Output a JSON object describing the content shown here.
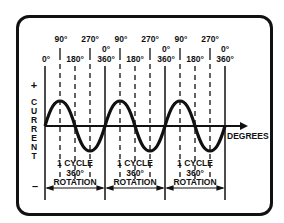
{
  "axis": {
    "y_label_letters": [
      "C",
      "U",
      "R",
      "R",
      "E",
      "N",
      "T"
    ],
    "y_plus": "+",
    "y_minus": "–",
    "x_label": "DEGREES"
  },
  "degree_labels": [
    {
      "text": "0°",
      "row": "low"
    },
    {
      "text": "90°",
      "row": "high"
    },
    {
      "text": "180°",
      "row": "low"
    },
    {
      "text": "270°",
      "row": "high"
    },
    {
      "text": "0°",
      "text2": "360°",
      "row": "mid"
    },
    {
      "text": "90°",
      "row": "high"
    },
    {
      "text": "180°",
      "row": "low"
    },
    {
      "text": "270°",
      "row": "high"
    },
    {
      "text": "0°",
      "text2": "360°",
      "row": "mid"
    },
    {
      "text": "90°",
      "row": "high"
    },
    {
      "text": "180°",
      "row": "low"
    },
    {
      "text": "270°",
      "row": "high"
    },
    {
      "text": "0°",
      "text2": "360°",
      "row": "mid"
    }
  ],
  "cycles": [
    {
      "line1": "1 CYCLE",
      "line2": "360°",
      "line3": "ROTATION"
    },
    {
      "line1": "1 CYCLE",
      "line2": "360°",
      "line3": "ROTATION"
    },
    {
      "line1": "1 CYCLE",
      "line2": "360°",
      "line3": "ROTATION"
    }
  ],
  "colors": {
    "ink": "#111111",
    "background": "#ffffff"
  }
}
